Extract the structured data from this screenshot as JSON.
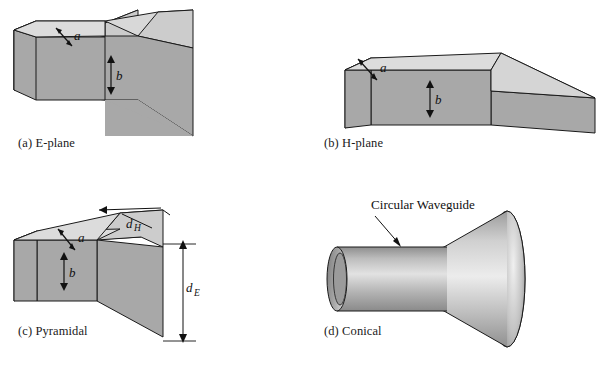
{
  "figure": {
    "background_color": "#ffffff",
    "stroke_color": "#1a1a1a",
    "fill_top": "#d2d2d2",
    "fill_side": "#a8a8a8",
    "fill_end_dark": "#8f8f8f",
    "fill_flare_light": "#c9c9c9"
  },
  "panels": {
    "e_plane": {
      "caption": "(a) E-plane",
      "labels": {
        "width": "a",
        "height": "b"
      }
    },
    "h_plane": {
      "caption": "(b) H-plane",
      "labels": {
        "width": "a",
        "height": "b"
      }
    },
    "pyramidal": {
      "caption": "(c) Pyramidal",
      "labels": {
        "width": "a",
        "height": "b",
        "aperture_h_base": "d",
        "aperture_h_sub": "H",
        "aperture_e_base": "d",
        "aperture_e_sub": "E"
      }
    },
    "conical": {
      "caption": "(d) Conical",
      "labels": {
        "waveguide": "Circular Waveguide"
      }
    }
  }
}
